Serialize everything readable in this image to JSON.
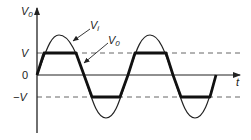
{
  "diagram": {
    "type": "waveform",
    "axes": {
      "y_label_main": "V",
      "y_label_sub": "0",
      "x_label": "t"
    },
    "levels": {
      "plus_v": "V",
      "zero": "0",
      "minus_v": "−V"
    },
    "curves": [
      {
        "name": "input",
        "label_main": "V",
        "label_sub": "i",
        "style": "thin"
      },
      {
        "name": "output",
        "label_main": "V",
        "label_sub": "0",
        "style": "thick, clipped at ±V"
      }
    ],
    "colors": {
      "line": "#222222",
      "dashed": "#666666",
      "background": "#ffffff"
    }
  }
}
